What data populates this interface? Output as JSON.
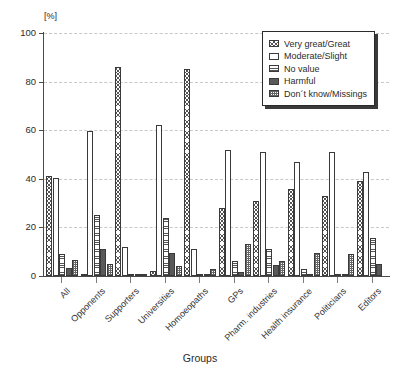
{
  "chart_data": {
    "type": "bar",
    "title": "",
    "xlabel": "Groups",
    "ylabel": "[%]",
    "unit_label": "[%]",
    "ylim": [
      0,
      100
    ],
    "yticks": [
      0,
      20,
      40,
      60,
      80,
      100
    ],
    "grid": true,
    "legend_position": "top-right",
    "categories": [
      "All",
      "Opponents",
      "Supporters",
      "Universities",
      "Homoeopaths",
      "GPs",
      "Pharm. industries",
      "Health insurance",
      "Politicians",
      "Editors"
    ],
    "series": [
      {
        "name": "Very great/Great",
        "pattern": "cross-hatch",
        "values": [
          41,
          0.5,
          86,
          2,
          85,
          28,
          31,
          36,
          33,
          39
        ]
      },
      {
        "name": "Moderate/Slight",
        "pattern": "white",
        "values": [
          40.5,
          59.5,
          12,
          62,
          11,
          52,
          51,
          47,
          51,
          43
        ]
      },
      {
        "name": "No value",
        "pattern": "horizontal-lines",
        "values": [
          9,
          25,
          0.5,
          24,
          1,
          6,
          11,
          3,
          1,
          15.5
        ]
      },
      {
        "name": "Harmful",
        "pattern": "solid-dark",
        "values": [
          3.5,
          11,
          1,
          9.5,
          0.5,
          1.5,
          4.5,
          0.5,
          0.5,
          5
        ]
      },
      {
        "name": "Don´t know/Missings",
        "pattern": "checker",
        "values": [
          6.5,
          5,
          0.5,
          4,
          3,
          13,
          6,
          9.5,
          9,
          0
        ]
      }
    ],
    "legend": [
      "Very great/Great",
      "Moderate/Slight",
      "No value",
      "Harmful",
      "Don´t know/Missings"
    ]
  }
}
